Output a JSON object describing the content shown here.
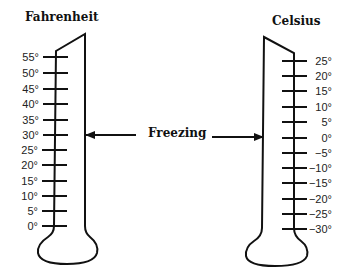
{
  "diagram": {
    "fahrenheit": {
      "title": "Fahrenheit",
      "ticks": [
        "55°",
        "50°",
        "45°",
        "40°",
        "35°",
        "30°",
        "25°",
        "20°",
        "15°",
        "10°",
        "5°",
        "0°"
      ]
    },
    "celsius": {
      "title": "Celsius",
      "ticks": [
        "25°",
        "20°",
        "15°",
        "10°",
        "5°",
        "0°",
        "−5°",
        "−10°",
        "−15°",
        "−20°",
        "−25°",
        "−30°"
      ]
    },
    "freezing_label": "Freezing",
    "colors": {
      "ink": "#111111",
      "background": "#ffffff"
    }
  }
}
